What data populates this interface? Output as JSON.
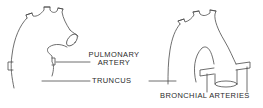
{
  "diagram": {
    "labels": {
      "pulmonary_artery_line1": "PULMONARY",
      "pulmonary_artery_line2": "ARTERY",
      "truncus": "TRUNCUS",
      "bronchial_arteries": "BRONCHIAL ARTERIES"
    },
    "figures": [
      {
        "name": "left-heart-truncus",
        "description": "Truncus with pulmonary artery branch"
      },
      {
        "name": "right-heart-truncus",
        "description": "Truncus with bronchial arteries"
      }
    ],
    "colors": {
      "line": "#4a4a4a",
      "text": "#2a2a2a",
      "background": "#ffffff"
    }
  }
}
